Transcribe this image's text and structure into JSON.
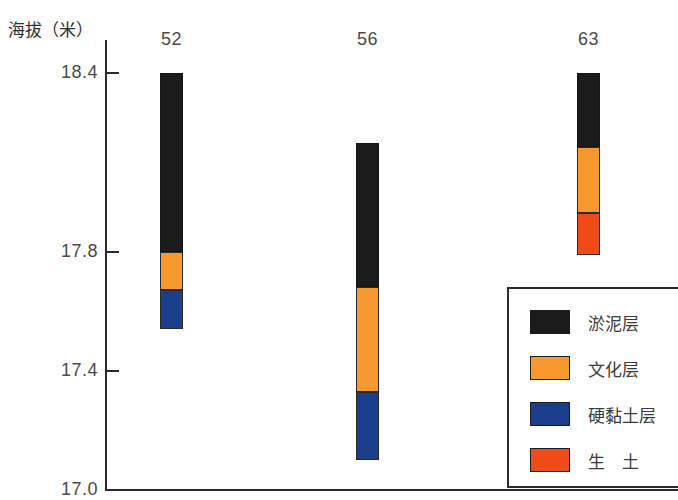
{
  "chart_data": {
    "type": "bar",
    "title": "",
    "subtitle": "",
    "xlabel": "",
    "ylabel": "海拔（米）",
    "ylim": [
      17.0,
      18.5
    ],
    "grid": false,
    "legend_position": "bottom-right",
    "stacked": true,
    "y_ticks": [
      {
        "label": "18.4",
        "value": 18.4
      },
      {
        "label": "17.8",
        "value": 17.8
      },
      {
        "label": "17.4",
        "value": 17.4
      },
      {
        "label": "17.0",
        "value": 17.0
      }
    ],
    "categories": [
      "52",
      "56",
      "63"
    ],
    "series": [
      {
        "name": "淤泥层",
        "color": "#1b1b1b",
        "values": [
          0.6,
          0.485,
          0.25
        ]
      },
      {
        "name": "文化层",
        "color": "#f7992f",
        "values": [
          0.13,
          0.35,
          0.22
        ]
      },
      {
        "name": "硬黏土层",
        "color": "#1b3e8c",
        "values": [
          0.13,
          0.23,
          0.0
        ]
      },
      {
        "name": "生　土",
        "color": "#ee4b18",
        "values": [
          0.0,
          0.0,
          0.14
        ]
      }
    ],
    "bars": [
      {
        "label": "52",
        "top": 18.4,
        "bottom": 17.54,
        "segments": [
          {
            "layer": "淤泥层",
            "top": 18.4,
            "bottom": 17.8,
            "color": "#1b1b1b"
          },
          {
            "layer": "文化层",
            "top": 17.8,
            "bottom": 17.67,
            "color": "#f7992f"
          },
          {
            "layer": "硬黏土层",
            "top": 17.67,
            "bottom": 17.54,
            "color": "#1b3e8c"
          }
        ]
      },
      {
        "label": "56",
        "top": 18.165,
        "bottom": 17.1,
        "segments": [
          {
            "layer": "淤泥层",
            "top": 18.165,
            "bottom": 17.68,
            "color": "#1b1b1b"
          },
          {
            "layer": "文化层",
            "top": 17.68,
            "bottom": 17.33,
            "color": "#f7992f"
          },
          {
            "layer": "硬黏土层",
            "top": 17.33,
            "bottom": 17.1,
            "color": "#1b3e8c"
          }
        ]
      },
      {
        "label": "63",
        "top": 18.4,
        "bottom": 17.79,
        "segments": [
          {
            "layer": "淤泥层",
            "top": 18.4,
            "bottom": 18.15,
            "color": "#1b1b1b"
          },
          {
            "layer": "文化层",
            "top": 18.15,
            "bottom": 17.93,
            "color": "#f7992f"
          },
          {
            "layer": "生　土",
            "top": 17.93,
            "bottom": 17.79,
            "color": "#ee4b18"
          }
        ]
      }
    ],
    "legend": [
      {
        "label": "淤泥层",
        "color": "#1b1b1b"
      },
      {
        "label": "文化层",
        "color": "#f7992f"
      },
      {
        "label": "硬黏土层",
        "color": "#1b3e8c"
      },
      {
        "label": "生　土",
        "color": "#ee4b18"
      }
    ]
  }
}
